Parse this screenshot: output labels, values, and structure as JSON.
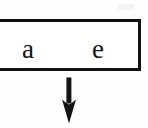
{
  "figure": {
    "type": "boxed-cell-with-downward-arrow",
    "background_color": "#fefefe",
    "ink_color": "#141414"
  },
  "cell": {
    "name": "boxed-cell",
    "border_color": "#111111",
    "border_width_px": 3,
    "fill_color": "#ffffff",
    "left_clipped": true,
    "entries": [
      {
        "label": "a",
        "position": "left"
      },
      {
        "label": "e",
        "position": "right"
      }
    ]
  },
  "arrow": {
    "name": "down-arrow",
    "direction": "down",
    "glyph": "↓",
    "color": "#141414",
    "points_from": "boxed-cell",
    "x_center_px": 69,
    "top_px": 77,
    "tip_px": 123
  },
  "artifacts": {
    "scan_specks": 2
  }
}
